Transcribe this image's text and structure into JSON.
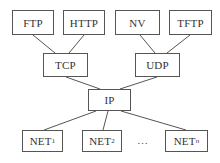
{
  "diagram": {
    "type": "protocol-stack-tree",
    "nodes": {
      "ftp": {
        "label": "FTP"
      },
      "http": {
        "label": "HTTP"
      },
      "nv": {
        "label": "NV"
      },
      "tftp": {
        "label": "TFTP"
      },
      "tcp": {
        "label": "TCP"
      },
      "udp": {
        "label": "UDP"
      },
      "ip": {
        "label": "IP"
      },
      "net1": {
        "label": "NET",
        "subscript": "1"
      },
      "net2": {
        "label": "NET",
        "subscript": "2"
      },
      "netn": {
        "label": "NET",
        "subscript": "n"
      }
    },
    "ellipsis": "…",
    "edges": [
      [
        "ftp",
        "tcp"
      ],
      [
        "http",
        "tcp"
      ],
      [
        "nv",
        "udp"
      ],
      [
        "tftp",
        "udp"
      ],
      [
        "tcp",
        "ip"
      ],
      [
        "udp",
        "ip"
      ],
      [
        "ip",
        "net1"
      ],
      [
        "ip",
        "net2"
      ],
      [
        "ip",
        "netn"
      ]
    ]
  }
}
